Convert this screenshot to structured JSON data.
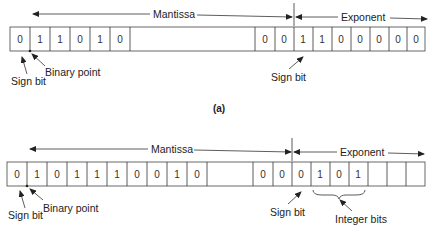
{
  "diagram": {
    "panel_a": {
      "caption": "(a)",
      "mantissa_label": "Mantissa",
      "exponent_label": "Exponent",
      "mantissa_leading_bits": [
        "0",
        "1",
        "1",
        "0",
        "1",
        "0"
      ],
      "mantissa_trailing_bits": [
        "0",
        "0"
      ],
      "exponent_bits": [
        "1",
        "1",
        "0",
        "0",
        "0",
        "0",
        "0"
      ],
      "annotations": {
        "sign_bit": "Sign bit",
        "binary_point": "Binary point",
        "exponent_sign_bit": "Sign bit"
      }
    },
    "panel_b": {
      "caption": "(b)",
      "mantissa_label": "Mantissa",
      "exponent_label": "Exponent",
      "mantissa_leading_bits": [
        "0",
        "1",
        "0",
        "1",
        "1",
        "1",
        "0",
        "0",
        "1",
        "0"
      ],
      "mantissa_trailing_bits": [
        "0",
        "0"
      ],
      "exponent_bits": [
        "0",
        "1",
        "0",
        "1",
        "",
        "",
        ""
      ],
      "annotations": {
        "sign_bit": "Sign bit",
        "binary_point": "Binary point",
        "exponent_sign_bit": "Sign bit",
        "integer_bits": "Integer bits"
      }
    }
  }
}
